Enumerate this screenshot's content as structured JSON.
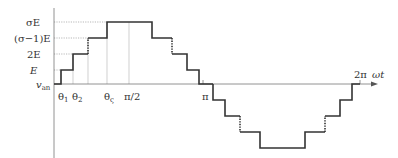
{
  "diagram": {
    "y_labels": {
      "sigmaE": "σE",
      "sigma_minus_1_E": "(σ−1)E",
      "twoE": "2E",
      "E": "E",
      "van": "v",
      "van_sub": "an"
    },
    "x_labels": {
      "theta1": "θ",
      "theta1_sub": "1",
      "theta2": "θ",
      "theta2_sub": "2",
      "thetaS": "θ",
      "thetaS_sub": "ς",
      "pi_half": "π/2",
      "pi": "π",
      "two_pi": "2π",
      "omega_t": "ωt"
    },
    "colors": {
      "waveform": "#333333",
      "grid": "#bbbbbb",
      "axis": "#777777"
    }
  }
}
